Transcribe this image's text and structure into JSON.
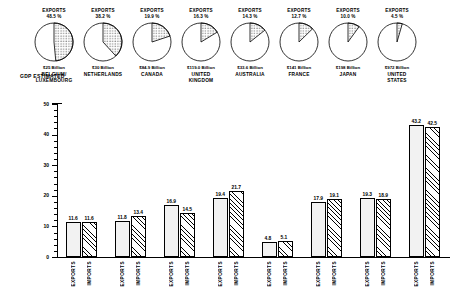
{
  "labels": {
    "gdp_estimated": "GDP ESTIMATED",
    "exports_header": "EXPORTS",
    "cat_exports": "EXPORTS",
    "cat_imports": "IMPORTS"
  },
  "chart_data": [
    {
      "type": "pie",
      "title": "Exports as percent of GDP",
      "note": "Eight separate single-wedge pies; wedge = exports share of GDP, starting at 12 o'clock clockwise",
      "slices": [
        {
          "country": "BELGIUM/ LUXEMBOURG",
          "country_lines": [
            "BELGIUM/",
            "LUXEMBOURG"
          ],
          "gdp": "$25 Billion",
          "header": "EXPORTS",
          "percent": 48.5,
          "percent_label": "48.5 %"
        },
        {
          "country": "NETHERLANDS",
          "country_lines": [
            "NETHERLANDS"
          ],
          "gdp": "$30 Billion",
          "header": "EXPORTS",
          "percent": 38.2,
          "percent_label": "38.2 %"
        },
        {
          "country": "CANADA",
          "country_lines": [
            "CANADA"
          ],
          "gdp": "$84.9 Billion",
          "header": "EXPORTS",
          "percent": 19.9,
          "percent_label": "19.9 %"
        },
        {
          "country": "UNITED KINGDOM",
          "country_lines": [
            "UNITED",
            "KINGDOM"
          ],
          "gdp": "$119.0 Billion",
          "header": "EXPORTS",
          "percent": 16.3,
          "percent_label": "16.3 %"
        },
        {
          "country": "AUSTRALIA",
          "country_lines": [
            "AUSTRALIA"
          ],
          "gdp": "$33.6 Billion",
          "header": "EXPORTS",
          "percent": 14.3,
          "percent_label": "14.3 %"
        },
        {
          "country": "FRANCE",
          "country_lines": [
            "FRANCE"
          ],
          "gdp": "$141 Billion",
          "header": "EXPORTS",
          "percent": 12.7,
          "percent_label": "12.7 %"
        },
        {
          "country": "JAPAN",
          "country_lines": [
            "JAPAN"
          ],
          "gdp": "$198 Billion",
          "header": "EXPORTS",
          "percent": 10.0,
          "percent_label": "10.0 %"
        },
        {
          "country": "UNITED STATES",
          "country_lines": [
            "UNITED",
            "STATES"
          ],
          "gdp": "$972 Billion",
          "header": "EXPORTS",
          "percent": 4.5,
          "percent_label": "4.5 %"
        }
      ]
    },
    {
      "type": "bar",
      "title": "",
      "xlabel": "",
      "ylabel": "",
      "ylim": [
        0,
        50
      ],
      "yticks": [
        0,
        10,
        20,
        30,
        40,
        50
      ],
      "ytick_labels": [
        "0",
        "10",
        "20",
        "30",
        "40",
        "50"
      ],
      "minor_tick_step": 2,
      "grid": false,
      "categories": [
        "BELGIUM/LUXEMBOURG",
        "NETHERLANDS",
        "CANADA",
        "UNITED KINGDOM",
        "AUSTRALIA",
        "FRANCE",
        "JAPAN",
        "UNITED STATES"
      ],
      "group_tick_labels": [
        "EXPORTS",
        "IMPORTS"
      ],
      "series": [
        {
          "name": "EXPORTS",
          "pattern": "dotted",
          "values": [
            11.6,
            11.8,
            16.9,
            19.4,
            4.8,
            17.9,
            19.3,
            43.2
          ],
          "value_labels": [
            "11.6",
            "11.8",
            "16.9",
            "19.4",
            "4.8",
            "17.9",
            "19.3",
            "43.2"
          ]
        },
        {
          "name": "IMPORTS",
          "pattern": "hatched",
          "values": [
            11.6,
            13.4,
            14.5,
            21.7,
            5.1,
            19.1,
            18.9,
            42.5
          ],
          "value_labels": [
            "11.6",
            "13.4",
            "14.5",
            "21.7",
            "5.1",
            "19.1",
            "18.9",
            "42.5"
          ]
        }
      ]
    }
  ]
}
